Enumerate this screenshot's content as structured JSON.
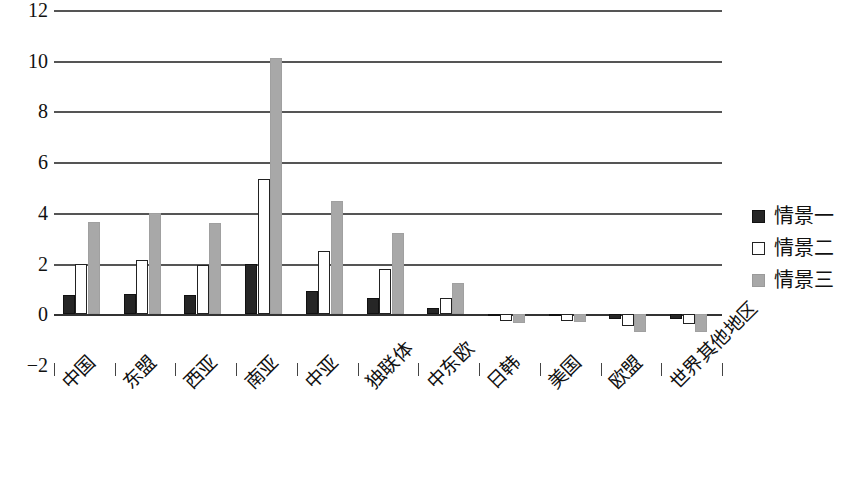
{
  "chart_data": {
    "type": "bar",
    "title": "",
    "subtitle": "",
    "xlabel": "",
    "ylabel": "",
    "ylim": [
      -2,
      12
    ],
    "y_ticks": [
      12,
      10,
      8,
      6,
      4,
      2,
      0,
      -2
    ],
    "y_tick_labels": [
      "12",
      "10",
      "8",
      "6",
      "4",
      "2",
      "0",
      "−2"
    ],
    "grid": true,
    "grid_axis": "y",
    "legend_position": "right",
    "categories": [
      "中国",
      "东盟",
      "西亚",
      "南亚",
      "中亚",
      "独联体",
      "中东欧",
      "日韩",
      "美国",
      "欧盟",
      "世界其他地区"
    ],
    "series": [
      {
        "name": "情景一",
        "color": "#262626",
        "style": "filled-dark",
        "values": [
          0.75,
          0.8,
          0.75,
          2.0,
          0.9,
          0.65,
          0.25,
          -0.08,
          -0.08,
          -0.2,
          -0.18
        ]
      },
      {
        "name": "情景二",
        "color": "#ffffff",
        "style": "outlined-white",
        "values": [
          2.0,
          2.15,
          1.95,
          5.35,
          2.5,
          1.8,
          0.65,
          -0.28,
          -0.25,
          -0.45,
          -0.4
        ]
      },
      {
        "name": "情景三",
        "color": "#a8a8a8",
        "style": "filled-gray",
        "values": [
          3.65,
          4.0,
          3.6,
          10.1,
          4.45,
          3.2,
          1.25,
          -0.35,
          -0.3,
          -0.7,
          -0.68
        ]
      }
    ]
  },
  "legend": {
    "items": [
      {
        "label": "情景一"
      },
      {
        "label": "情景二"
      },
      {
        "label": "情景三"
      }
    ]
  }
}
